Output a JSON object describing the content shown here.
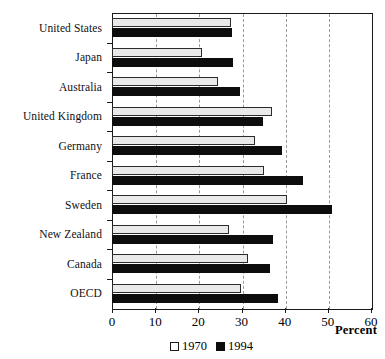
{
  "chart_data": {
    "type": "bar",
    "orientation": "horizontal",
    "title": "",
    "xlabel": "Percent",
    "ylabel": "",
    "xlim": [
      0,
      60
    ],
    "xticks": [
      0,
      10,
      20,
      30,
      40,
      50,
      60
    ],
    "grid": "vertical-dashed",
    "legend_position": "bottom-center",
    "categories": [
      "United States",
      "Japan",
      "Australia",
      "United Kingdom",
      "Germany",
      "France",
      "Sweden",
      "New Zealand",
      "Canada",
      "OECD"
    ],
    "series": [
      {
        "name": "1970",
        "color": "#e9e9e9",
        "values": [
          27.6,
          20.8,
          24.6,
          37.1,
          33.1,
          35.2,
          40.5,
          27.1,
          31.5,
          29.9
        ]
      },
      {
        "name": "1994",
        "color": "#0d0d0d",
        "values": [
          27.8,
          28.0,
          29.7,
          35.0,
          39.4,
          44.2,
          51.0,
          37.3,
          36.6,
          38.4
        ]
      }
    ]
  },
  "legend": {
    "items": [
      {
        "label": "1970",
        "swatch": "white-square-outline"
      },
      {
        "label": "1994",
        "swatch": "black-square-filled"
      }
    ]
  },
  "axis": {
    "x_title": "Percent",
    "tick_labels": [
      "0",
      "10",
      "20",
      "30",
      "40",
      "50",
      "60"
    ]
  }
}
